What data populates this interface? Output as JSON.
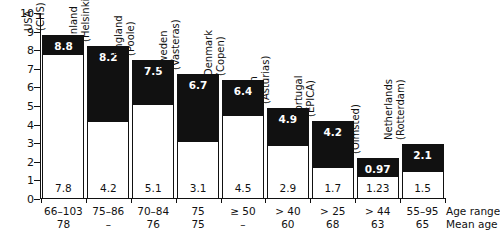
{
  "chart_data": {
    "type": "bar",
    "title": "",
    "subtitle": "",
    "xlabel": "",
    "ylabel": "",
    "ylim": [
      0,
      10
    ],
    "yticks": [
      0,
      1,
      2,
      3,
      4,
      5,
      6,
      7,
      8,
      9,
      10
    ],
    "grid": false,
    "legend_position": "none",
    "stacked": true,
    "note": "Each bar is drawn to the total value (black label at top). The white lower segment is drawn to the base value (black label at bottom). The black segment is the difference between total and base.",
    "categories": [
      "USA (CHS)",
      "Finland (Helsinki)",
      "England (Poole)",
      "Sweden (Vasteras)",
      "Denmark (Copen)",
      "Spain (Asturias)",
      "Portugal (EPICA)",
      "USA (Olmsted)",
      "Netherlands (Rotterdam)"
    ],
    "series": [
      {
        "name": "Base (lower, white)",
        "values": [
          7.8,
          4.2,
          5.1,
          3.1,
          4.5,
          2.9,
          1.7,
          1.23,
          1.5
        ]
      },
      {
        "name": "Total (upper, black)",
        "values": [
          8.8,
          8.2,
          7.5,
          6.7,
          6.4,
          4.9,
          4.2,
          0.97,
          2.1
        ]
      }
    ],
    "bars": [
      {
        "country": "USA",
        "site": "(CHS)",
        "total": "8.8",
        "total_value": 8.8,
        "base": "7.8",
        "base_value": 7.8,
        "age_range": "66–103",
        "mean_age": "78"
      },
      {
        "country": "Finland",
        "site": "(Helsinki)",
        "total": "8.2",
        "total_value": 8.2,
        "base": "4.2",
        "base_value": 4.2,
        "age_range": "75–86",
        "mean_age": "–"
      },
      {
        "country": "England",
        "site": "(Poole)",
        "total": "7.5",
        "total_value": 7.5,
        "base": "5.1",
        "base_value": 5.1,
        "age_range": "70–84",
        "mean_age": "76"
      },
      {
        "country": "Sweden",
        "site": "(Vasteras)",
        "total": "6.7",
        "total_value": 6.7,
        "base": "3.1",
        "base_value": 3.1,
        "age_range": "75",
        "mean_age": "75"
      },
      {
        "country": "Denmark",
        "site": "(Copen)",
        "total": "6.4",
        "total_value": 6.4,
        "base": "4.5",
        "base_value": 4.5,
        "age_range": "≥ 50",
        "mean_age": "–"
      },
      {
        "country": "Spain",
        "site": "(Asturias)",
        "total": "4.9",
        "total_value": 4.9,
        "base": "2.9",
        "base_value": 2.9,
        "age_range": "> 40",
        "mean_age": "60"
      },
      {
        "country": "Portugal",
        "site": "(EPICA)",
        "total": "4.2",
        "total_value": 4.2,
        "base": "1.7",
        "base_value": 1.7,
        "age_range": "> 25",
        "mean_age": "68"
      },
      {
        "country": "USA",
        "site": "(Olmsted)",
        "total": "0.97",
        "total_value": 2.2,
        "base": "1.23",
        "base_value": 1.23,
        "age_range": "> 44",
        "mean_age": "63"
      },
      {
        "country": "Netherlands",
        "site": "(Rotterdam)",
        "total": "2.1",
        "total_value": 2.95,
        "base": "1.5",
        "base_value": 1.5,
        "age_range": "55–95",
        "mean_age": "65"
      }
    ],
    "axis_legend": {
      "row1": "Age range",
      "row2": "Mean age"
    },
    "colors": {
      "bar_upper": "#111111",
      "bar_lower": "#ffffff",
      "axis": "#111111",
      "text": "#111111",
      "text_on_dark": "#ffffff"
    }
  }
}
